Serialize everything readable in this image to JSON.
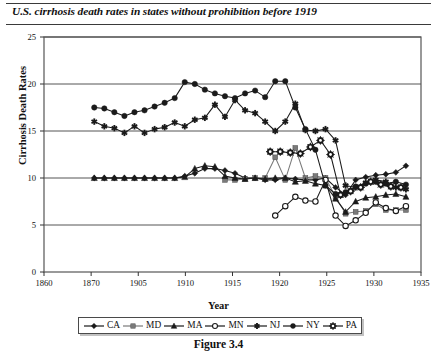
{
  "chart_data": {
    "type": "line",
    "title": "U.S. cirrhosis death rates in states without prohibition before 1919",
    "caption": "Figure 3.4",
    "xlabel": "Year",
    "ylabel": "Cirrhosis Death Rates",
    "xlim": [
      1860,
      1935
    ],
    "ylim": [
      0,
      25
    ],
    "yticks": [
      0,
      5,
      10,
      15,
      20,
      25
    ],
    "xticks": [
      1860,
      1870,
      1905,
      1910,
      1915,
      1920,
      1925,
      1930,
      1935
    ],
    "grid": "horizontal",
    "legend_position": "below-axis",
    "series": [
      {
        "name": "CA",
        "marker": "diamond",
        "color": "#1a1a1a",
        "x": [
          1870,
          1872,
          1874,
          1876,
          1878,
          1880,
          1882,
          1884,
          1886,
          1888,
          1890,
          1892,
          1894,
          1896,
          1898,
          1900,
          1902,
          1904,
          1906,
          1908,
          1910,
          1912,
          1914,
          1916,
          1918,
          1920,
          1922,
          1924,
          1926,
          1928,
          1930,
          1932
        ],
        "y": [
          10.0,
          10.0,
          10.0,
          10.0,
          10.0,
          10.0,
          10.0,
          10.0,
          10.0,
          10.2,
          10.5,
          11.0,
          11.0,
          10.8,
          10.5,
          10.0,
          10.0,
          9.8,
          9.8,
          10.0,
          9.9,
          9.8,
          9.8,
          10.0,
          9.0,
          8.2,
          9.8,
          10.1,
          10.3,
          10.4,
          10.6,
          11.3
        ]
      },
      {
        "name": "MD",
        "marker": "square",
        "color": "#7a7a7a",
        "x": [
          1896,
          1898,
          1900,
          1902,
          1904,
          1906,
          1908,
          1910,
          1912,
          1914,
          1916,
          1918,
          1920,
          1922,
          1924,
          1926,
          1928,
          1930,
          1932
        ],
        "y": [
          9.8,
          9.8,
          9.9,
          10.0,
          10.0,
          12.2,
          9.8,
          13.2,
          10.0,
          10.2,
          10.0,
          8.0,
          6.2,
          6.4,
          6.5,
          7.2,
          6.6,
          6.6,
          6.6
        ]
      },
      {
        "name": "MA",
        "marker": "triangle",
        "color": "#1a1a1a",
        "x": [
          1870,
          1872,
          1874,
          1876,
          1878,
          1880,
          1882,
          1884,
          1886,
          1888,
          1890,
          1892,
          1894,
          1896,
          1898,
          1900,
          1902,
          1904,
          1906,
          1908,
          1910,
          1912,
          1914,
          1916,
          1918,
          1920,
          1922,
          1924,
          1926,
          1928,
          1930,
          1932
        ],
        "y": [
          10.0,
          10.0,
          10.0,
          10.0,
          10.0,
          10.0,
          10.0,
          10.0,
          10.0,
          10.1,
          11.0,
          11.3,
          11.2,
          10.2,
          10.0,
          9.9,
          10.0,
          9.9,
          10.0,
          10.0,
          9.6,
          9.7,
          9.4,
          9.2,
          7.8,
          6.4,
          7.5,
          7.9,
          8.0,
          8.2,
          8.3,
          8.0
        ]
      },
      {
        "name": "MN",
        "marker": "open-circle",
        "color": "#1a1a1a",
        "x": [
          1906,
          1908,
          1910,
          1912,
          1914,
          1916,
          1918,
          1920,
          1922,
          1924,
          1926,
          1928,
          1930,
          1932
        ],
        "y": [
          6.0,
          7.0,
          8.0,
          7.6,
          7.5,
          9.8,
          6.0,
          4.9,
          5.5,
          6.3,
          7.4,
          6.8,
          6.5,
          7.0
        ]
      },
      {
        "name": "NJ",
        "marker": "asterisk",
        "color": "#1a1a1a",
        "x": [
          1870,
          1872,
          1874,
          1876,
          1878,
          1880,
          1882,
          1884,
          1886,
          1888,
          1890,
          1892,
          1894,
          1896,
          1898,
          1900,
          1902,
          1904,
          1906,
          1908,
          1910,
          1912,
          1914,
          1916,
          1918,
          1920,
          1922,
          1924,
          1926,
          1928,
          1930,
          1932
        ],
        "y": [
          16.0,
          15.5,
          15.3,
          14.8,
          15.5,
          14.8,
          15.2,
          15.4,
          15.9,
          15.5,
          16.2,
          16.4,
          17.8,
          16.5,
          18.3,
          17.2,
          16.9,
          16.0,
          15.0,
          16.0,
          17.9,
          15.1,
          15.0,
          15.2,
          14.0,
          9.2,
          9.0,
          9.5,
          9.8,
          9.6,
          9.0,
          8.8
        ]
      },
      {
        "name": "NY",
        "marker": "circle",
        "color": "#1a1a1a",
        "x": [
          1870,
          1872,
          1874,
          1876,
          1878,
          1880,
          1882,
          1884,
          1886,
          1888,
          1890,
          1892,
          1894,
          1896,
          1898,
          1900,
          1902,
          1904,
          1906,
          1908,
          1910,
          1912,
          1914,
          1916,
          1918,
          1920,
          1922,
          1924,
          1926,
          1928,
          1930,
          1932
        ],
        "y": [
          17.5,
          17.4,
          17.0,
          16.6,
          17.0,
          17.2,
          17.6,
          18.0,
          18.5,
          20.2,
          20.0,
          19.4,
          19.0,
          18.7,
          18.5,
          19.0,
          19.3,
          18.6,
          20.3,
          20.3,
          17.5,
          15.2,
          13.0,
          9.2,
          8.3,
          8.5,
          9.1,
          9.4,
          9.6,
          9.4,
          9.6,
          9.3
        ]
      },
      {
        "name": "PA",
        "marker": "crossed-circle",
        "color": "#1a1a1a",
        "x": [
          1905,
          1907,
          1909,
          1911,
          1913,
          1915,
          1917,
          1919,
          1921,
          1923,
          1925,
          1927,
          1929,
          1931
        ],
        "y": [
          12.8,
          12.8,
          12.7,
          12.6,
          13.3,
          14.0,
          12.5,
          8.2,
          8.6,
          9.0,
          9.6,
          9.3,
          9.1,
          9.0
        ]
      }
    ]
  }
}
